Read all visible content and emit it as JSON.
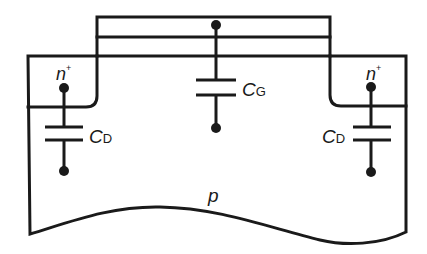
{
  "diagram": {
    "type": "MOSFET cross-section with parasitic capacitances",
    "labels": {
      "left_region": "n",
      "left_region_sup": "+",
      "right_region": "n",
      "right_region_sup": "+",
      "gate_cap_main": "C",
      "gate_cap_sub": "G",
      "left_cap_main": "C",
      "left_cap_sub": "D",
      "right_cap_main": "C",
      "right_cap_sub": "D",
      "substrate": "p"
    },
    "colors": {
      "stroke": "#1a1a1a",
      "background": "#ffffff"
    }
  }
}
